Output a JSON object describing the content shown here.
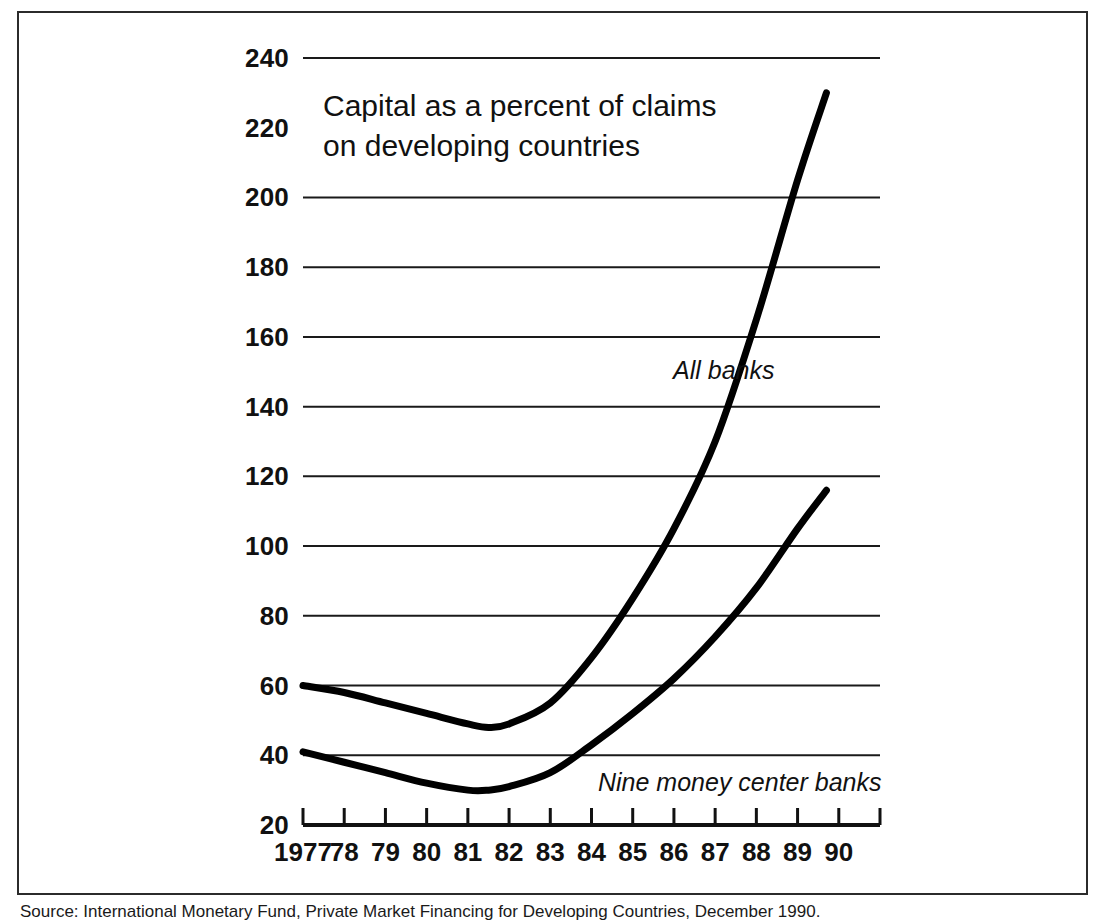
{
  "chart_data": {
    "type": "line",
    "title": "Capital as a percent of claims\non developing countries",
    "xlabel": "",
    "ylabel": "",
    "xlim": [
      1977,
      1991
    ],
    "ylim": [
      20,
      240
    ],
    "ytick_step": 20,
    "grid": "horizontal",
    "legend_position": "inline-annotations",
    "x_tick_labels": [
      "1977",
      "78",
      "79",
      "80",
      "81",
      "82",
      "83",
      "84",
      "85",
      "86",
      "87",
      "88",
      "89",
      "90"
    ],
    "y_tick_labels": [
      "240",
      "220",
      "200",
      "180",
      "160",
      "140",
      "120",
      "100",
      "80",
      "60",
      "40",
      "20"
    ],
    "y_values": [
      240,
      220,
      200,
      180,
      160,
      140,
      120,
      100,
      80,
      60,
      40,
      20
    ],
    "x": [
      1977,
      1978,
      1979,
      1980,
      1981,
      1981.5,
      1982,
      1983,
      1984,
      1985,
      1986,
      1987,
      1988,
      1989,
      1989.7
    ],
    "series": [
      {
        "name": "All banks",
        "values": [
          60,
          58,
          55,
          52,
          49,
          48,
          49,
          55,
          68,
          85,
          105,
          130,
          165,
          205,
          230
        ]
      },
      {
        "name": "Nine money center banks",
        "values": [
          41,
          38,
          35,
          32,
          30,
          30,
          31,
          35,
          43,
          52,
          62,
          74,
          88,
          105,
          116
        ]
      }
    ],
    "annotations": [
      {
        "text": "All banks",
        "x": 1986.2,
        "y": 150,
        "style": "italic"
      },
      {
        "text": "Nine money center banks",
        "x": 1984.4,
        "y": 33,
        "style": "italic"
      }
    ],
    "colors": {
      "line": "#000000",
      "grid": "#1a1a1a",
      "axis": "#111111",
      "frame": "#2b2b2b",
      "background": "#ffffff"
    }
  },
  "source": {
    "note": "Source: International Monetary Fund, Private Market Financing for Developing Countries, December 1990."
  }
}
